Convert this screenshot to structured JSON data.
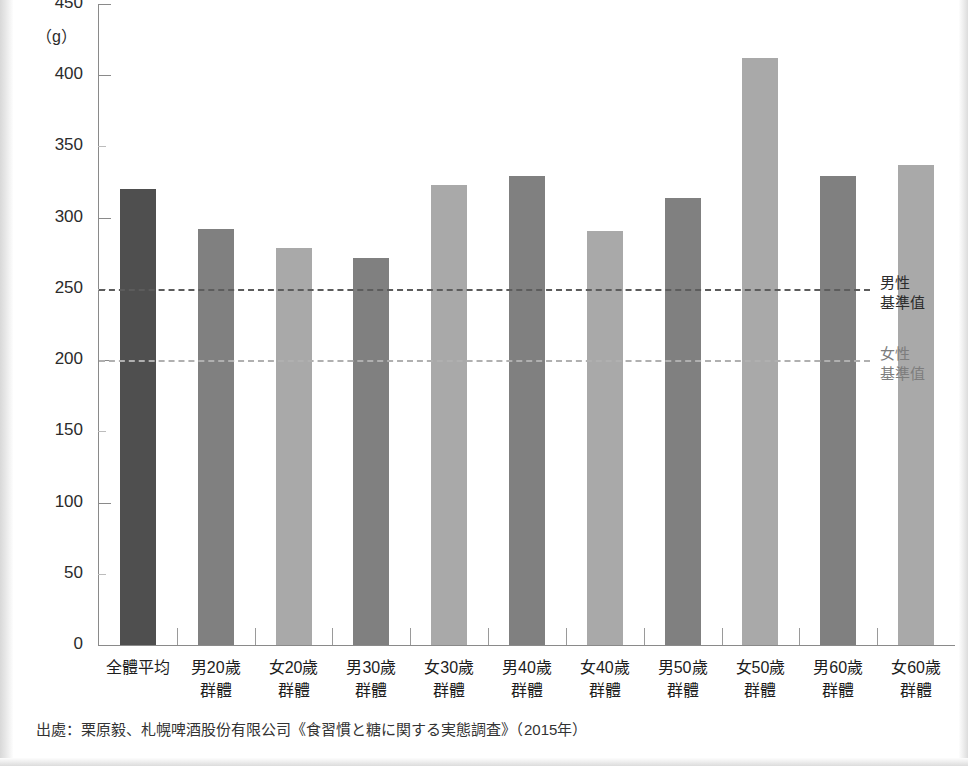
{
  "chart_data": {
    "type": "bar",
    "title": "",
    "subtitle": "",
    "xlabel": "",
    "ylabel": "",
    "unit_label": "（g）",
    "ylim": [
      0,
      450
    ],
    "yticks": [
      0,
      50,
      100,
      150,
      200,
      250,
      300,
      350,
      400,
      450
    ],
    "ytick_labels": [
      "0",
      "50",
      "100",
      "150",
      "200",
      "250",
      "300",
      "350",
      "400",
      "450"
    ],
    "grid": false,
    "legend": "none",
    "categories": [
      "全體平均",
      "男20歲\n群體",
      "女20歲\n群體",
      "男30歲\n群體",
      "女30歲\n群體",
      "男40歲\n群體",
      "女40歲\n群體",
      "男50歲\n群體",
      "女50歲\n群體",
      "男60歲\n群體",
      "女60歲\n群體"
    ],
    "bars": [
      {
        "label_line1": "全體平均",
        "label_line2": "",
        "value": 320,
        "group": "average",
        "color": "#4f4f4f"
      },
      {
        "label_line1": "男20歲",
        "label_line2": "群體",
        "value": 292,
        "group": "male",
        "color": "#808080"
      },
      {
        "label_line1": "女20歲",
        "label_line2": "群體",
        "value": 279,
        "group": "female",
        "color": "#a9a9a9"
      },
      {
        "label_line1": "男30歲",
        "label_line2": "群體",
        "value": 272,
        "group": "male",
        "color": "#808080"
      },
      {
        "label_line1": "女30歲",
        "label_line2": "群體",
        "value": 323,
        "group": "female",
        "color": "#a9a9a9"
      },
      {
        "label_line1": "男40歲",
        "label_line2": "群體",
        "value": 329,
        "group": "male",
        "color": "#808080"
      },
      {
        "label_line1": "女40歲",
        "label_line2": "群體",
        "value": 291,
        "group": "female",
        "color": "#a9a9a9"
      },
      {
        "label_line1": "男50歲",
        "label_line2": "群體",
        "value": 314,
        "group": "male",
        "color": "#808080"
      },
      {
        "label_line1": "女50歲",
        "label_line2": "群體",
        "value": 412,
        "group": "female",
        "color": "#a9a9a9"
      },
      {
        "label_line1": "男60歲",
        "label_line2": "群體",
        "value": 329,
        "group": "male",
        "color": "#808080"
      },
      {
        "label_line1": "女60歲",
        "label_line2": "群體",
        "value": 337,
        "group": "female",
        "color": "#a9a9a9"
      }
    ],
    "values": [
      320,
      292,
      279,
      272,
      323,
      329,
      291,
      314,
      412,
      329,
      337
    ],
    "reference_lines": [
      {
        "value": 250,
        "label_line1": "男性",
        "label_line2": "基準值",
        "color": "#5c5c5c",
        "style": "dashed"
      },
      {
        "value": 200,
        "label_line1": "女性",
        "label_line2": "基準值",
        "color": "#b0b0b0",
        "style": "dashed"
      }
    ],
    "annotations": []
  },
  "source": {
    "note": "出處：栗原毅、札幌啤酒股份有限公司《食習慣と糖に関する実態調査》（2015年）"
  },
  "colors": {
    "average_bar": "#4f4f4f",
    "male_bar": "#808080",
    "female_bar": "#a9a9a9",
    "axis": "#8a8a8a",
    "male_ref_line": "#5c5c5c",
    "female_ref_line": "#b0b0b0",
    "text": "#1d1d1d"
  }
}
